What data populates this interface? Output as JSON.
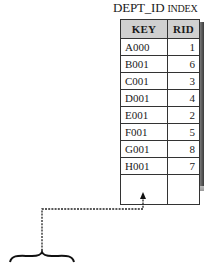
{
  "title": {
    "main": "DEPT_ID ",
    "smallcaps": "INDEX"
  },
  "table": {
    "headers": {
      "key": "KEY",
      "rid": "RID"
    },
    "rows": [
      {
        "key": "A000",
        "rid": "1"
      },
      {
        "key": "B001",
        "rid": "6"
      },
      {
        "key": "C001",
        "rid": "3"
      },
      {
        "key": "D001",
        "rid": "4"
      },
      {
        "key": "E001",
        "rid": "2"
      },
      {
        "key": "F001",
        "rid": "5"
      },
      {
        "key": "G001",
        "rid": "8"
      },
      {
        "key": "H001",
        "rid": "7"
      }
    ]
  },
  "connector": {
    "style": "dashed",
    "color": "#222222"
  }
}
